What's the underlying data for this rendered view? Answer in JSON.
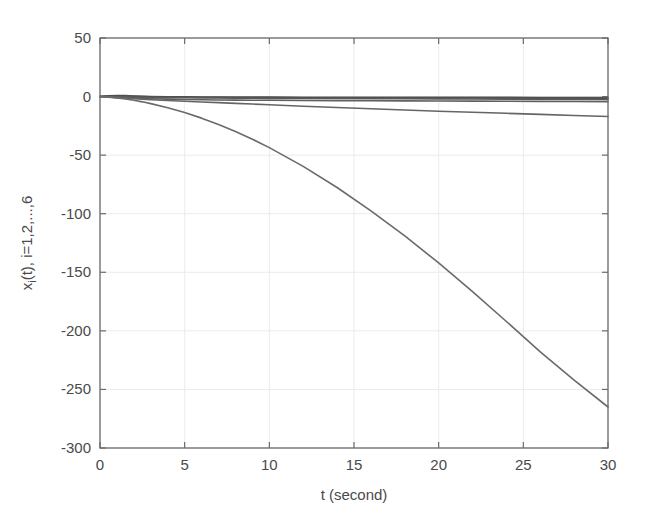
{
  "figure": {
    "background_color": "#ffffff",
    "axis_color": "#6b6b6b",
    "grid_color": "#ebebeb",
    "text_color": "#4a4a4a"
  },
  "chart_data": {
    "type": "line",
    "title": "",
    "xlabel": "t (second)",
    "ylabel_parts": {
      "lead": "x",
      "sub": "i",
      "tail": "(t), i=1,2,...,6"
    },
    "ylabel": "x_i(t), i=1,2,...,6",
    "xlim": [
      0,
      30
    ],
    "ylim": [
      -300,
      50
    ],
    "xticks": [
      0,
      5,
      10,
      15,
      20,
      25,
      30
    ],
    "xtick_labels": [
      "0",
      "5",
      "10",
      "15",
      "20",
      "25",
      "30"
    ],
    "yticks": [
      50,
      0,
      -50,
      -100,
      -150,
      -200,
      -250,
      -300
    ],
    "ytick_labels": [
      "50",
      "0",
      "-50",
      "-100",
      "-150",
      "-200",
      "-250",
      "-300"
    ],
    "grid": true,
    "legend": "none",
    "x": [
      0,
      0.5,
      1,
      1.5,
      2,
      2.5,
      3,
      4,
      5,
      6,
      7,
      8,
      9,
      10,
      12,
      14,
      16,
      18,
      20,
      22,
      24,
      26,
      28,
      30
    ],
    "series": [
      {
        "name": "x_1(t)",
        "color": "#555555",
        "width": 1.6,
        "values": [
          0,
          0.6,
          0.9,
          0.8,
          0.5,
          0.2,
          0,
          -0.2,
          -0.3,
          -0.4,
          -0.4,
          -0.5,
          -0.5,
          -0.5,
          -0.6,
          -0.6,
          -0.6,
          -0.7,
          -0.7,
          -0.7,
          -0.7,
          -0.8,
          -0.8,
          -0.8
        ]
      },
      {
        "name": "x_2(t)",
        "color": "#4f4f4f",
        "width": 1.6,
        "values": [
          0,
          0.4,
          0.6,
          0.5,
          0.3,
          0.1,
          -0.1,
          -0.3,
          -0.5,
          -0.6,
          -0.7,
          -0.8,
          -0.8,
          -0.9,
          -1.0,
          -1.0,
          -1.1,
          -1.1,
          -1.2,
          -1.2,
          -1.3,
          -1.3,
          -1.4,
          -1.4
        ]
      },
      {
        "name": "x_3(t)",
        "color": "#5a5a5a",
        "width": 1.6,
        "values": [
          0,
          -0.2,
          -0.4,
          -0.5,
          -0.6,
          -0.7,
          -0.8,
          -0.9,
          -1.0,
          -1.1,
          -1.2,
          -1.3,
          -1.4,
          -1.5,
          -1.6,
          -1.7,
          -1.8,
          -1.9,
          -2.0,
          -2.1,
          -2.2,
          -2.3,
          -2.4,
          -2.5
        ]
      },
      {
        "name": "x_4(t)",
        "color": "#606060",
        "width": 1.6,
        "values": [
          0,
          -0.3,
          -0.7,
          -1.0,
          -1.3,
          -1.6,
          -1.9,
          -2.2,
          -2.5,
          -2.7,
          -2.9,
          -3.0,
          -3.1,
          -3.2,
          -3.4,
          -3.5,
          -3.6,
          -3.7,
          -3.8,
          -3.9,
          -4.0,
          -4.1,
          -4.2,
          -4.3
        ]
      },
      {
        "name": "x_5(t)",
        "color": "#656565",
        "width": 1.6,
        "values": [
          0,
          -0.4,
          -0.9,
          -1.4,
          -1.9,
          -2.3,
          -2.7,
          -3.4,
          -4.0,
          -4.6,
          -5.2,
          -5.8,
          -6.4,
          -7.0,
          -8.2,
          -9.3,
          -10.4,
          -11.5,
          -12.5,
          -13.4,
          -14.3,
          -15.2,
          -16.1,
          -17.0
        ]
      },
      {
        "name": "x_6(t)",
        "color": "#6a6a6a",
        "width": 1.6,
        "values": [
          0,
          -0.5,
          -1.2,
          -2.1,
          -3.2,
          -4.5,
          -6.0,
          -9.5,
          -13.6,
          -18.4,
          -23.8,
          -29.8,
          -36.4,
          -43.6,
          -59.6,
          -77.6,
          -97.5,
          -119.0,
          -142.0,
          -166.5,
          -192.0,
          -218.0,
          -242.0,
          -265.0
        ]
      }
    ]
  }
}
